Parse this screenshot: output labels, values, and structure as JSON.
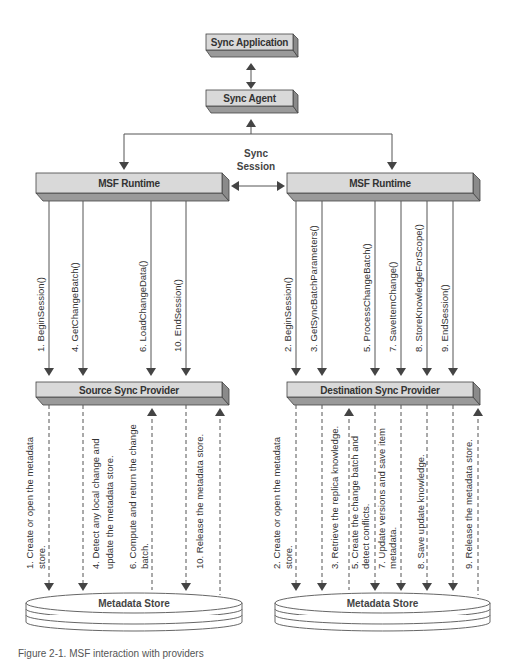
{
  "diagram": {
    "top": {
      "sync_application": "Sync Application",
      "sync_agent": "Sync Agent",
      "session_label_line1": "Sync",
      "session_label_line2": "Session"
    },
    "source": {
      "runtime_label": "MSF Runtime",
      "provider_label": "Source Sync Provider",
      "store_label": "Metadata Store",
      "calls": [
        {
          "x": 49,
          "label": "1. BeginSession()"
        },
        {
          "x": 83,
          "label": "4. GetChangeBatch()"
        },
        {
          "x": 151,
          "label": "6. LoadChangeData()"
        },
        {
          "x": 186,
          "label": "10. EndSession()"
        }
      ],
      "store_ops": [
        {
          "x": 49,
          "direction": "down",
          "lines": [
            "1. Create or open the metadata",
            "store."
          ]
        },
        {
          "x": 83,
          "direction": "down",
          "lines": [
            "4. Detect any local change and",
            "update the metadata store."
          ]
        },
        {
          "x": 152,
          "direction": "up",
          "lines": [
            "6. Compute and return the change",
            "batch."
          ]
        },
        {
          "x": 186,
          "direction": "down",
          "lines": [
            "10. Release the metadata store."
          ]
        },
        {
          "x": 220,
          "direction": "up",
          "lines": []
        }
      ]
    },
    "destination": {
      "runtime_label": "MSF Runtime",
      "provider_label": "Destination Sync Provider",
      "store_label": "Metadata Store",
      "calls": [
        {
          "x": 296,
          "label": "2. BeginSession()"
        },
        {
          "x": 322,
          "label": "3. GetSyncBatchParameters()"
        },
        {
          "x": 375,
          "label": "5. ProcessChangeBatch()"
        },
        {
          "x": 401,
          "label": "7. SaveItemChange()"
        },
        {
          "x": 427,
          "label": "8. StoreKnowledgeForScope()"
        },
        {
          "x": 453,
          "label": "9. EndSession()"
        }
      ],
      "store_ops": [
        {
          "x": 296,
          "direction": "down",
          "lines": [
            "2. Create or open the metadata",
            "store."
          ]
        },
        {
          "x": 322,
          "direction": "down",
          "lines": [
            "3. Retrieve the replica knowledge."
          ]
        },
        {
          "x": 349,
          "direction": "up",
          "lines": [
            "5. Create the change batch and",
            "detect conflicts."
          ]
        },
        {
          "x": 375,
          "direction": "down",
          "lines": [
            "7. Update versions and save item",
            "metadata."
          ]
        },
        {
          "x": 401,
          "direction": "down",
          "lines": []
        },
        {
          "x": 427,
          "direction": "down",
          "lines": [
            "8. Save update knowledge."
          ]
        },
        {
          "x": 453,
          "direction": "down",
          "lines": [
            "9. Release the metadata store."
          ]
        },
        {
          "x": 478,
          "direction": "up",
          "lines": []
        }
      ]
    },
    "caption": "Figure 2-1. MSF interaction with providers"
  }
}
